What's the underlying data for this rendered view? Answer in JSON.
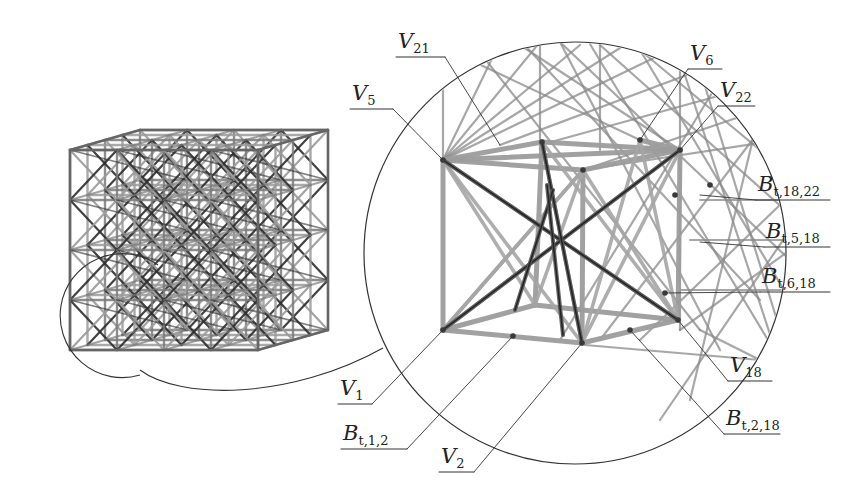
{
  "figure": {
    "colors": {
      "line": "#333333",
      "beam_light": "#9a9a9a",
      "beam_mid": "#7a7a7a",
      "beam_dark": "#2e2e2e",
      "node": "#3a3a3a"
    }
  },
  "labels": [
    {
      "id": "V21",
      "base": "V",
      "sub": "21",
      "x": 398,
      "y": 48,
      "line_x2": 445,
      "leader_to": [
        500,
        145
      ]
    },
    {
      "id": "V5",
      "base": "V",
      "sub": "5",
      "x": 352,
      "y": 100,
      "line_x2": 393,
      "leader_to": [
        443,
        160
      ]
    },
    {
      "id": "V6",
      "base": "V",
      "sub": "6",
      "x": 690,
      "y": 60,
      "line_x2": 722,
      "leader_to": [
        640,
        140
      ]
    },
    {
      "id": "V22",
      "base": "V",
      "sub": "22",
      "x": 720,
      "y": 97,
      "line_x2": 755,
      "leader_to": [
        680,
        150
      ]
    },
    {
      "id": "Bt18_22",
      "base": "B",
      "sub": "t,18,22",
      "x": 758,
      "y": 191,
      "line_x2": 830,
      "leader_to": [
        700,
        195
      ]
    },
    {
      "id": "Bt5_18",
      "base": "B",
      "sub": "t,5,18",
      "x": 766,
      "y": 238,
      "line_x2": 830,
      "leader_to": [
        700,
        242
      ]
    },
    {
      "id": "Bt6_18",
      "base": "B",
      "sub": "t,6,18",
      "x": 762,
      "y": 283,
      "line_x2": 830,
      "leader_to": [
        665,
        293
      ]
    },
    {
      "id": "V18",
      "base": "V",
      "sub": "18",
      "x": 730,
      "y": 372,
      "line_x2": 772,
      "leader_to": [
        678,
        320
      ]
    },
    {
      "id": "Bt2_18",
      "base": "B",
      "sub": "t,2,18",
      "x": 726,
      "y": 425,
      "line_x2": 780,
      "leader_to": [
        630,
        330
      ]
    },
    {
      "id": "V1",
      "base": "V",
      "sub": "1",
      "x": 340,
      "y": 395,
      "line_x2": 372,
      "leader_to": [
        443,
        330
      ]
    },
    {
      "id": "Bt1_2",
      "base": "B",
      "sub": "t,1,2",
      "x": 343,
      "y": 440,
      "line_x2": 407,
      "leader_to": [
        513,
        336
      ]
    },
    {
      "id": "V2",
      "base": "V",
      "sub": "2",
      "x": 441,
      "y": 463,
      "line_x2": 474,
      "leader_to": [
        582,
        343
      ]
    }
  ],
  "magnifier": {
    "cx": 575,
    "cy": 253,
    "r": 211
  },
  "source_circle": {
    "cx": 140,
    "cy": 315,
    "r": 62
  }
}
